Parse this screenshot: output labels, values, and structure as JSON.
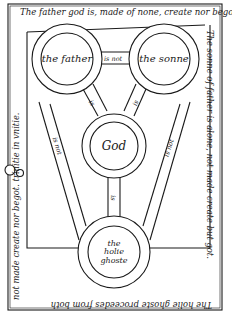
{
  "border_text": {
    "top": "The father god is, made of none, create nor begot",
    "right": "The sonne of father is alone, not made create but got.",
    "bottom": "The holie ghoste proceedes from both",
    "left": "not made create nor begot. trinitie in vnitie."
  },
  "nodes": {
    "father": "the father",
    "sonne": "the sonne",
    "god": "God",
    "holie_ghoste_line1": "the",
    "holie_ghoste_line2": "holie ghoste"
  },
  "edges": {
    "father_sonne": "is not",
    "father_god": "is",
    "sonne_god": "is",
    "holie_ghoste_god": "is",
    "father_holie_ghoste": "is not",
    "sonne_holie_ghoste": "is not"
  },
  "colors": {
    "ink": "#1a1a1a",
    "paper": "#ffffff"
  }
}
